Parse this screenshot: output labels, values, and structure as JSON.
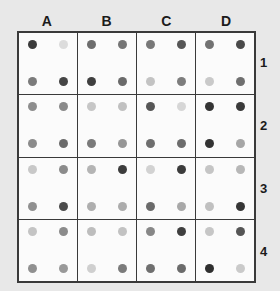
{
  "page": {
    "background_color": "#e8e8e8",
    "grid_line_color": "#3a3a3a",
    "cell_background_color": "#fbfbfb"
  },
  "column_headers": [
    "A",
    "B",
    "C",
    "D"
  ],
  "row_headers": [
    "1",
    "2",
    "3",
    "4"
  ],
  "chart_data": {
    "type": "heatmap",
    "title": "",
    "xlabel": "",
    "ylabel": "",
    "columns": [
      "A",
      "B",
      "C",
      "D"
    ],
    "rows": [
      "1",
      "2",
      "3",
      "4"
    ],
    "dot_positions": [
      "top-left",
      "top-right",
      "bottom-left",
      "bottom-right"
    ],
    "grid": 4,
    "legend": "none",
    "note": "Each grid cell contains four gray dots arranged 2x2; value encoded as gray level hex.",
    "cells": [
      {
        "id": "A1",
        "column": "A",
        "row": "1",
        "dots": {
          "top_left": "#3b3b3b",
          "top_right": "#dcdcdc",
          "bottom_left": "#7b7b7b",
          "bottom_right": "#454545"
        }
      },
      {
        "id": "B1",
        "column": "B",
        "row": "1",
        "dots": {
          "top_left": "#6d6d6d",
          "top_right": "#757575",
          "bottom_left": "#3f3f3f",
          "bottom_right": "#6a6a6a"
        }
      },
      {
        "id": "C1",
        "column": "C",
        "row": "1",
        "dots": {
          "top_left": "#787878",
          "top_right": "#565656",
          "bottom_left": "#c3c3c3",
          "bottom_right": "#7d7d7d"
        }
      },
      {
        "id": "D1",
        "column": "D",
        "row": "1",
        "dots": {
          "top_left": "#727272",
          "top_right": "#4a4a4a",
          "bottom_left": "#c9c9c9",
          "bottom_right": "#6f6f6f"
        }
      },
      {
        "id": "A2",
        "column": "A",
        "row": "2",
        "dots": {
          "top_left": "#8d8d8d",
          "top_right": "#8a8a8a",
          "bottom_left": "#8b8b8b",
          "bottom_right": "#6b6b6b"
        }
      },
      {
        "id": "B2",
        "column": "B",
        "row": "2",
        "dots": {
          "top_left": "#c6c6c6",
          "top_right": "#c0c0c0",
          "bottom_left": "#7a7a7a",
          "bottom_right": "#969696"
        }
      },
      {
        "id": "C2",
        "column": "C",
        "row": "2",
        "dots": {
          "top_left": "#565656",
          "top_right": "#d6d6d6",
          "bottom_left": "#6e6e6e",
          "bottom_right": "#6c6c6c"
        }
      },
      {
        "id": "D2",
        "column": "D",
        "row": "2",
        "dots": {
          "top_left": "#343434",
          "top_right": "#3a3a3a",
          "bottom_left": "#333333",
          "bottom_right": "#a6a6a6"
        }
      },
      {
        "id": "A3",
        "column": "A",
        "row": "3",
        "dots": {
          "top_left": "#c8c8c8",
          "top_right": "#8b8b8b",
          "bottom_left": "#909090",
          "bottom_right": "#4b4b4b"
        }
      },
      {
        "id": "B3",
        "column": "B",
        "row": "3",
        "dots": {
          "top_left": "#b4b4b4",
          "top_right": "#3c3c3c",
          "bottom_left": "#aeaeae",
          "bottom_right": "#acacac"
        }
      },
      {
        "id": "C3",
        "column": "C",
        "row": "3",
        "dots": {
          "top_left": "#d2d2d2",
          "top_right": "#3b3b3b",
          "bottom_left": "#6a6a6a",
          "bottom_right": "#a8a8a8"
        }
      },
      {
        "id": "D3",
        "column": "D",
        "row": "3",
        "dots": {
          "top_left": "#c5c5c5",
          "top_right": "#b7b7b7",
          "bottom_left": "#c0c0c0",
          "bottom_right": "#363636"
        }
      },
      {
        "id": "A4",
        "column": "A",
        "row": "4",
        "dots": {
          "top_left": "#c4c4c4",
          "top_right": "#8b8b8b",
          "bottom_left": "#909090",
          "bottom_right": "#999999"
        }
      },
      {
        "id": "B4",
        "column": "B",
        "row": "4",
        "dots": {
          "top_left": "#bdbdbd",
          "top_right": "#c2c2c2",
          "bottom_left": "#cfcfcf",
          "bottom_right": "#7b7b7b"
        }
      },
      {
        "id": "C4",
        "column": "C",
        "row": "4",
        "dots": {
          "top_left": "#878787",
          "top_right": "#3f3f3f",
          "bottom_left": "#6f6f6f",
          "bottom_right": "#6b6b6b"
        }
      },
      {
        "id": "D4",
        "column": "D",
        "row": "4",
        "dots": {
          "top_left": "#c6c6c6",
          "top_right": "#555555",
          "bottom_left": "#2f2f2f",
          "bottom_right": "#cacaca"
        }
      }
    ]
  }
}
